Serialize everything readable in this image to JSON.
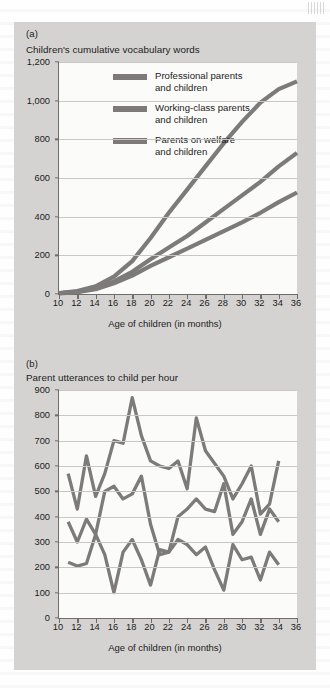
{
  "figure": {
    "panels": [
      {
        "tag": "(a)",
        "title": "Children's cumulative vocabulary words",
        "xlabel": "Age of children (in months)"
      },
      {
        "tag": "(b)",
        "title": "Parent utterances to child per hour",
        "xlabel": "Age of children (in months)"
      }
    ],
    "legend": [
      {
        "label_line1": "Professional parents",
        "label_line2": "and children",
        "color": "#7d7b79"
      },
      {
        "label_line1": "Working-class parents",
        "label_line2": "and children",
        "color": "#7d7b79"
      },
      {
        "label_line1": "Parents on welfare",
        "label_line2": "and children",
        "color": "#7d7b79"
      }
    ],
    "colors": {
      "figure_background": "#d5d3d1",
      "plot_background": "#fbfbfa",
      "axis": "#6f6d6b",
      "gridline": "#c9c7c5",
      "series": "#7d7b79",
      "text": "#1b1b1b"
    }
  },
  "chart_data": [
    {
      "type": "line",
      "panel": "(a)",
      "title": "Children's cumulative vocabulary words",
      "xlabel": "Age of children (in months)",
      "ylabel": "",
      "xlim": [
        10,
        36
      ],
      "ylim": [
        0,
        1200
      ],
      "xticks": [
        10,
        12,
        14,
        16,
        18,
        20,
        22,
        24,
        26,
        28,
        30,
        32,
        34,
        36
      ],
      "xtick_labels": [
        "10",
        "12",
        "14",
        "16",
        "18",
        "20",
        "22",
        "24",
        "26",
        "28",
        "30",
        "32",
        "34",
        "36"
      ],
      "yticks": [
        0,
        200,
        400,
        600,
        800,
        1000,
        1200
      ],
      "ytick_labels": [
        "0",
        "200",
        "400",
        "600",
        "800",
        "1,000",
        "1,200"
      ],
      "grid": true,
      "legend_position": "inside-top-left",
      "x": [
        10,
        12,
        14,
        16,
        18,
        20,
        22,
        24,
        26,
        28,
        30,
        32,
        34,
        36
      ],
      "series": [
        {
          "name": "Professional parents and children",
          "values": [
            5,
            15,
            40,
            90,
            170,
            290,
            420,
            540,
            660,
            780,
            890,
            990,
            1060,
            1100
          ]
        },
        {
          "name": "Working-class parents and children",
          "values": [
            4,
            12,
            30,
            65,
            115,
            180,
            240,
            300,
            370,
            440,
            510,
            580,
            660,
            730
          ]
        },
        {
          "name": "Parents on welfare and children",
          "values": [
            3,
            10,
            25,
            55,
            95,
            145,
            190,
            235,
            280,
            325,
            370,
            420,
            475,
            525
          ]
        }
      ]
    },
    {
      "type": "line",
      "panel": "(b)",
      "title": "Parent utterances to child per hour",
      "xlabel": "Age of children (in months)",
      "ylabel": "",
      "xlim": [
        10,
        36
      ],
      "ylim": [
        0,
        900
      ],
      "xticks": [
        10,
        12,
        14,
        16,
        18,
        20,
        22,
        24,
        26,
        28,
        30,
        32,
        34,
        36
      ],
      "xtick_labels": [
        "10",
        "12",
        "14",
        "16",
        "18",
        "20",
        "22",
        "24",
        "26",
        "28",
        "30",
        "32",
        "34",
        "36"
      ],
      "yticks": [
        0,
        100,
        200,
        300,
        400,
        500,
        600,
        700,
        800,
        900
      ],
      "ytick_labels": [
        "0",
        "100",
        "200",
        "300",
        "400",
        "500",
        "600",
        "700",
        "800",
        "900"
      ],
      "grid": true,
      "legend_position": "none",
      "x": [
        11,
        12,
        13,
        14,
        15,
        16,
        17,
        18,
        19,
        20,
        21,
        22,
        23,
        24,
        25,
        26,
        27,
        28,
        29,
        30,
        31,
        32,
        33,
        34
      ],
      "series": [
        {
          "name": "Professional parents and children",
          "values": [
            570,
            430,
            640,
            480,
            570,
            700,
            690,
            870,
            720,
            620,
            600,
            590,
            620,
            510,
            790,
            660,
            610,
            560,
            470,
            530,
            600,
            410,
            450,
            620,
            560
          ]
        },
        {
          "name": "Working-class parents and children",
          "values": [
            380,
            300,
            390,
            330,
            500,
            520,
            470,
            490,
            560,
            370,
            250,
            260,
            400,
            430,
            470,
            430,
            420,
            530,
            330,
            380,
            470,
            330,
            430,
            380,
            300
          ]
        },
        {
          "name": "Parents on welfare and children",
          "values": [
            220,
            205,
            215,
            330,
            250,
            100,
            260,
            310,
            230,
            130,
            270,
            260,
            310,
            290,
            250,
            280,
            190,
            110,
            290,
            230,
            240,
            150,
            260,
            210,
            100
          ]
        }
      ]
    }
  ]
}
